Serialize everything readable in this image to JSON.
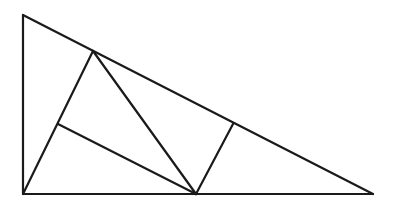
{
  "diagram": {
    "type": "geometry",
    "stroke_color": "#1a1a1a",
    "stroke_width": 2.2,
    "background": "#ffffff",
    "points": {
      "A": [
        23,
        15
      ],
      "B": [
        23,
        194
      ],
      "C": [
        373,
        194
      ],
      "D": [
        93,
        51
      ],
      "E": [
        58,
        124
      ],
      "F": [
        196,
        194
      ],
      "G": [
        233,
        124
      ]
    },
    "segments": [
      {
        "id": "AB",
        "from": "A",
        "to": "B",
        "role": "triangle-left-leg"
      },
      {
        "id": "BC",
        "from": "B",
        "to": "C",
        "role": "triangle-base"
      },
      {
        "id": "AC",
        "from": "A",
        "to": "C",
        "role": "triangle-hypotenuse"
      },
      {
        "id": "BD",
        "from": "B",
        "to": "D",
        "role": "inner-segment"
      },
      {
        "id": "DF",
        "from": "D",
        "to": "F",
        "role": "inner-segment"
      },
      {
        "id": "EF",
        "from": "E",
        "to": "F",
        "role": "inner-segment"
      },
      {
        "id": "FG",
        "from": "F",
        "to": "G",
        "role": "inner-segment"
      }
    ]
  }
}
